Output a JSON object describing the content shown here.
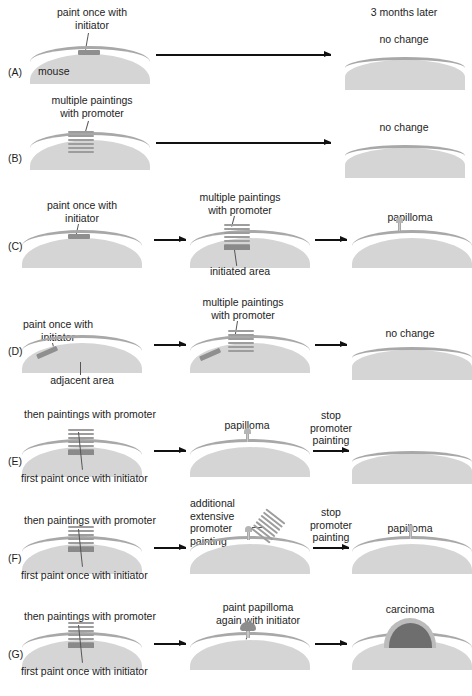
{
  "figure": {
    "header_right": "3 months later",
    "background_color": "#ffffff",
    "skin_body_color": "#d5d5d5",
    "epidermis_color": "#a8a8a8",
    "initiator_color": "#8f8f8f",
    "promoter_color": "#9d9d9d",
    "carcinoma_color": "#6e6e6e"
  },
  "panels": [
    {
      "letter": "(A)",
      "labels": {
        "initiator": "paint once with\ninitiator",
        "organism": "mouse",
        "outcome": "no change"
      }
    },
    {
      "letter": "(B)",
      "labels": {
        "promoter": "multiple paintings\nwith promoter",
        "outcome": "no change"
      }
    },
    {
      "letter": "(C)",
      "labels": {
        "initiator": "paint once with\ninitiator",
        "promoter": "multiple paintings\nwith promoter",
        "initiated_area": "initiated area",
        "outcome": "papilloma"
      }
    },
    {
      "letter": "(D)",
      "labels": {
        "initiator": "paint once with\ninitiator",
        "adjacent_area": "adjacent area",
        "promoter": "multiple paintings\nwith promoter",
        "outcome": "no change"
      }
    },
    {
      "letter": "(E)",
      "labels": {
        "promoter": "then paintings with promoter",
        "initiator": "first paint once with initiator",
        "middle_outcome": "papilloma",
        "stop": "stop\npromoter\npainting"
      }
    },
    {
      "letter": "(F)",
      "labels": {
        "promoter": "then paintings with promoter",
        "initiator": "first paint once with initiator",
        "extensive": "additional\nextensive\npromoter\npainting",
        "stop": "stop\npromoter\npainting",
        "outcome": "papilloma"
      }
    },
    {
      "letter": "(G)",
      "labels": {
        "promoter": "then paintings with promoter",
        "initiator": "first paint once with initiator",
        "repaint": "paint papilloma\nagain with initiator",
        "outcome": "carcinoma"
      }
    }
  ]
}
